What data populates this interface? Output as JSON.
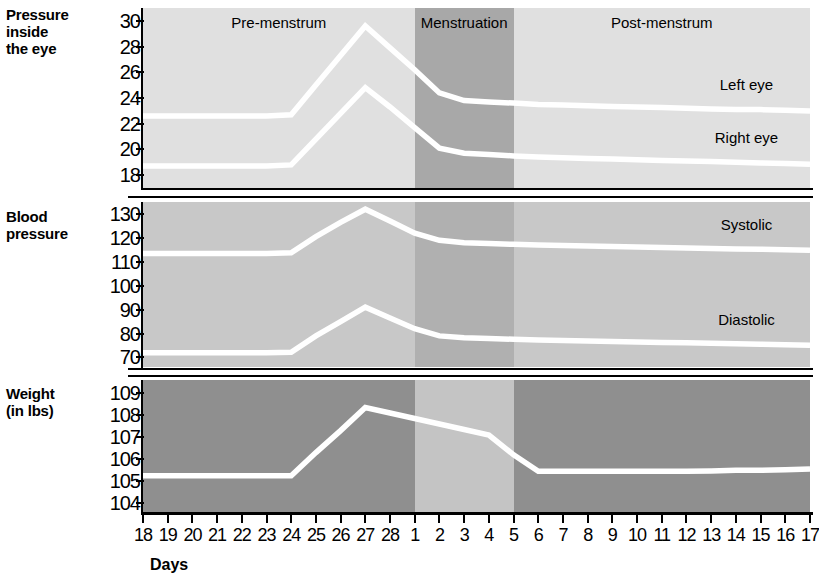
{
  "figure": {
    "xlabel": "Days",
    "phases": [
      {
        "name": "Pre-menstrum",
        "label": "Pre-menstrum",
        "start_day_index": 0,
        "end_day_index": 11,
        "shade": "#e0e0e0"
      },
      {
        "name": "Menstruation",
        "label": "Menstruation",
        "start_day_index": 11,
        "end_day_index": 15,
        "shade": "#a8a8a8"
      },
      {
        "name": "Post-menstrum",
        "label": "Post-menstrum",
        "start_day_index": 15,
        "end_day_index": 27,
        "shade": "#e0e0e0"
      }
    ],
    "x_categories": [
      "18",
      "19",
      "20",
      "21",
      "22",
      "23",
      "24",
      "25",
      "26",
      "27",
      "28",
      "1",
      "2",
      "3",
      "4",
      "5",
      "6",
      "7",
      "8",
      "9",
      "10",
      "11",
      "12",
      "13",
      "14",
      "15",
      "16",
      "17"
    ]
  },
  "colors": {
    "line": "#ffffff",
    "axis": "#000000",
    "light_shade": "#e0e0e0",
    "mid_shade": "#c8c8c8",
    "dark_shade": "#a8a8a8",
    "panel3_base": "#8f8f8f",
    "panel3_menstruation": "#c4c4c4",
    "background": "#ffffff"
  },
  "chart_data": [
    {
      "type": "line",
      "title": "Pressure inside the eye",
      "row_title": "Pressure\ninside\nthe eye",
      "xlabel": "Days",
      "ylabel": "Pressure inside the eye",
      "ylim": [
        17,
        31
      ],
      "yticks": [
        30,
        28,
        26,
        24,
        22,
        20,
        18
      ],
      "grid": false,
      "x": [
        "18",
        "19",
        "20",
        "21",
        "22",
        "23",
        "24",
        "25",
        "26",
        "27",
        "28",
        "1",
        "2",
        "3",
        "4",
        "5",
        "6",
        "7",
        "8",
        "9",
        "10",
        "11",
        "12",
        "13",
        "14",
        "15",
        "16",
        "17"
      ],
      "series": [
        {
          "name": "Left eye",
          "label": "Left eye",
          "label_at_day": "12",
          "values": [
            22.6,
            22.6,
            22.6,
            22.6,
            22.6,
            22.6,
            22.7,
            25.0,
            27.3,
            29.6,
            27.9,
            26.2,
            24.4,
            23.8,
            23.7,
            23.6,
            23.5,
            23.45,
            23.4,
            23.35,
            23.3,
            23.25,
            23.2,
            23.15,
            23.1,
            23.1,
            23.05,
            23.0
          ]
        },
        {
          "name": "Right eye",
          "label": "Right eye",
          "label_at_day": "12",
          "values": [
            18.7,
            18.7,
            18.7,
            18.7,
            18.7,
            18.7,
            18.8,
            20.8,
            22.8,
            24.8,
            23.3,
            21.7,
            20.1,
            19.7,
            19.6,
            19.5,
            19.4,
            19.35,
            19.3,
            19.25,
            19.2,
            19.15,
            19.1,
            19.05,
            19.0,
            18.95,
            18.9,
            18.85
          ]
        }
      ]
    },
    {
      "type": "line",
      "title": "Blood pressure",
      "row_title": "Blood\npressure",
      "xlabel": "Days",
      "ylabel": "Blood pressure",
      "ylim": [
        66,
        135
      ],
      "yticks": [
        130,
        120,
        110,
        100,
        90,
        80,
        70
      ],
      "grid": false,
      "x": [
        "18",
        "19",
        "20",
        "21",
        "22",
        "23",
        "24",
        "25",
        "26",
        "27",
        "28",
        "1",
        "2",
        "3",
        "4",
        "5",
        "6",
        "7",
        "8",
        "9",
        "10",
        "11",
        "12",
        "13",
        "14",
        "15",
        "16",
        "17"
      ],
      "series": [
        {
          "name": "Systolic",
          "label": "Systolic",
          "label_at_day": "12",
          "values": [
            113.5,
            113.5,
            113.5,
            113.5,
            113.5,
            113.5,
            113.8,
            120.5,
            126.5,
            132.0,
            127.0,
            122.0,
            119.0,
            118.0,
            117.6,
            117.3,
            117.0,
            116.8,
            116.6,
            116.4,
            116.2,
            116.0,
            115.8,
            115.6,
            115.4,
            115.2,
            115.0,
            114.8
          ]
        },
        {
          "name": "Diastolic",
          "label": "Diastolic",
          "label_at_day": "12",
          "values": [
            72.0,
            72.0,
            72.0,
            72.0,
            72.0,
            72.0,
            72.2,
            79.0,
            85.0,
            91.0,
            86.5,
            82.0,
            79.0,
            78.2,
            77.9,
            77.6,
            77.3,
            77.1,
            76.9,
            76.7,
            76.5,
            76.3,
            76.1,
            75.9,
            75.7,
            75.5,
            75.3,
            75.1
          ]
        }
      ]
    },
    {
      "type": "line",
      "title": "Weight (in lbs)",
      "row_title": "Weight\n(in lbs)",
      "xlabel": "Days",
      "ylabel": "Weight (in lbs)",
      "ylim": [
        103.6,
        109.6
      ],
      "yticks": [
        109,
        108,
        107,
        106,
        105,
        104
      ],
      "grid": false,
      "x": [
        "18",
        "19",
        "20",
        "21",
        "22",
        "23",
        "24",
        "25",
        "26",
        "27",
        "28",
        "1",
        "2",
        "3",
        "4",
        "5",
        "6",
        "7",
        "8",
        "9",
        "10",
        "11",
        "12",
        "13",
        "14",
        "15",
        "16",
        "17"
      ],
      "series": [
        {
          "name": "Weight",
          "label": "",
          "values": [
            105.25,
            105.25,
            105.25,
            105.25,
            105.25,
            105.25,
            105.25,
            106.3,
            107.3,
            108.35,
            108.1,
            107.85,
            107.6,
            107.35,
            107.1,
            106.2,
            105.45,
            105.45,
            105.45,
            105.45,
            105.45,
            105.45,
            105.45,
            105.47,
            105.5,
            105.5,
            105.52,
            105.55
          ]
        }
      ]
    }
  ]
}
